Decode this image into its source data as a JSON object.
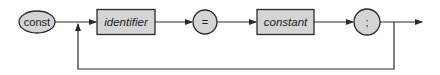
{
  "diagram": {
    "type": "syntax-diagram",
    "colors": {
      "node_fill": "#d4d4d4",
      "stroke": "#2a2a2a",
      "background": "#ffffff"
    },
    "nodes": [
      {
        "id": "const",
        "shape": "ellipse",
        "label": "const",
        "kind": "keyword"
      },
      {
        "id": "identifier",
        "shape": "rectangle",
        "label": "identifier",
        "kind": "non-terminal"
      },
      {
        "id": "equals",
        "shape": "circle",
        "label": "=",
        "kind": "terminal"
      },
      {
        "id": "constant",
        "shape": "rectangle",
        "label": "constant",
        "kind": "non-terminal"
      },
      {
        "id": "semicolon",
        "shape": "circle",
        "label": ";",
        "kind": "terminal"
      }
    ],
    "edges": [
      {
        "from": "const",
        "to": "identifier"
      },
      {
        "from": "identifier",
        "to": "equals"
      },
      {
        "from": "equals",
        "to": "constant"
      },
      {
        "from": "constant",
        "to": "semicolon"
      },
      {
        "from": "semicolon",
        "to": "exit"
      },
      {
        "from": "semicolon",
        "to": "identifier",
        "type": "loop-back"
      }
    ]
  }
}
